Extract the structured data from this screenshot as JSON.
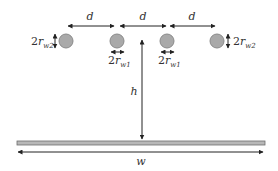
{
  "diagram": {
    "title": "",
    "labels": {
      "spacing": "d",
      "height": "h",
      "width": "w",
      "outer_diameter_prefix": "2",
      "outer_diameter_var": "r",
      "outer_diameter_sub": "w2",
      "inner_diameter_prefix": "2",
      "inner_diameter_var": "r",
      "inner_diameter_sub": "w1"
    },
    "wires": [
      {
        "id": "outer-left",
        "radius_label": "r_w2"
      },
      {
        "id": "inner-left",
        "radius_label": "r_w1"
      },
      {
        "id": "inner-right",
        "radius_label": "r_w1"
      },
      {
        "id": "outer-right",
        "radius_label": "r_w2"
      }
    ],
    "colors": {
      "wire_fill": "#a9a9a9",
      "wire_stroke": "#8a8a8a",
      "plate_fill": "#b8b8b8",
      "plate_stroke": "#6e6e6e",
      "arrow": "#222222"
    }
  }
}
